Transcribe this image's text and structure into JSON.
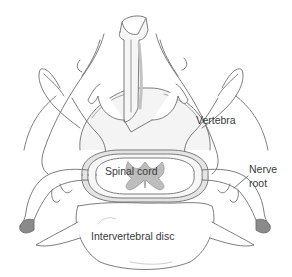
{
  "diagram": {
    "type": "anatomical-illustration",
    "labels": {
      "vertebra": "Vertebra",
      "spinal_cord": "Spinal cord",
      "nerve_root_line1": "Nerve",
      "nerve_root_line2": "root",
      "intervertebral_disc": "Intervertebral disc"
    },
    "colors": {
      "outline": "#6e6e6e",
      "shade": "#d4d4d4",
      "grey_matter": "#b9b9b9",
      "cut_end": "#8a8a8a",
      "text": "#3a3a3a",
      "background": "#ffffff"
    }
  }
}
